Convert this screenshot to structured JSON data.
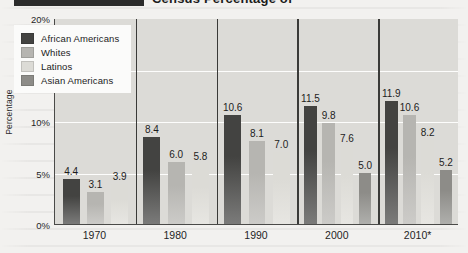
{
  "header": {
    "title": "Census Percentage of"
  },
  "chart_data": {
    "type": "bar",
    "title": "Census Percentage of",
    "xlabel": "",
    "ylabel": "Percentage",
    "ylim": [
      0,
      20
    ],
    "yticks": [
      "0%",
      "5%",
      "10%",
      "15%",
      "20%"
    ],
    "ytick_values": [
      0,
      5,
      10,
      15,
      20
    ],
    "grid": true,
    "legend_position": "top-left",
    "categories": [
      "1970",
      "1980",
      "1990",
      "2000",
      "2010*"
    ],
    "series": [
      {
        "name": "African Americans",
        "color": "#434341",
        "values": [
          4.4,
          8.4,
          10.6,
          11.5,
          11.9
        ],
        "labels": [
          "4.4",
          "8.4",
          "10.6",
          "11.5",
          "11.9"
        ]
      },
      {
        "name": "Whites",
        "color": "#b6b5b1",
        "values": [
          3.1,
          6.0,
          8.1,
          9.8,
          10.6
        ],
        "labels": [
          "3.1",
          "6.0",
          "8.1",
          "9.8",
          "10.6"
        ]
      },
      {
        "name": "Latinos",
        "color": "#dcdbd6",
        "values": [
          3.9,
          5.8,
          7.0,
          7.6,
          8.2
        ],
        "labels": [
          "3.9",
          "5.8",
          "7.0",
          "7.6",
          "8.2"
        ]
      },
      {
        "name": "Asian Americans",
        "color": "#8d8c88",
        "values": [
          null,
          null,
          null,
          5.0,
          5.2
        ],
        "labels": [
          null,
          null,
          null,
          "5.0",
          "5.2"
        ]
      }
    ]
  },
  "legend": {
    "items": [
      {
        "label": "African Americans",
        "color": "#434341"
      },
      {
        "label": "Whites",
        "color": "#b6b5b1"
      },
      {
        "label": "Latinos",
        "color": "#dcdbd6"
      },
      {
        "label": "Asian Americans",
        "color": "#8d8c88"
      }
    ]
  }
}
